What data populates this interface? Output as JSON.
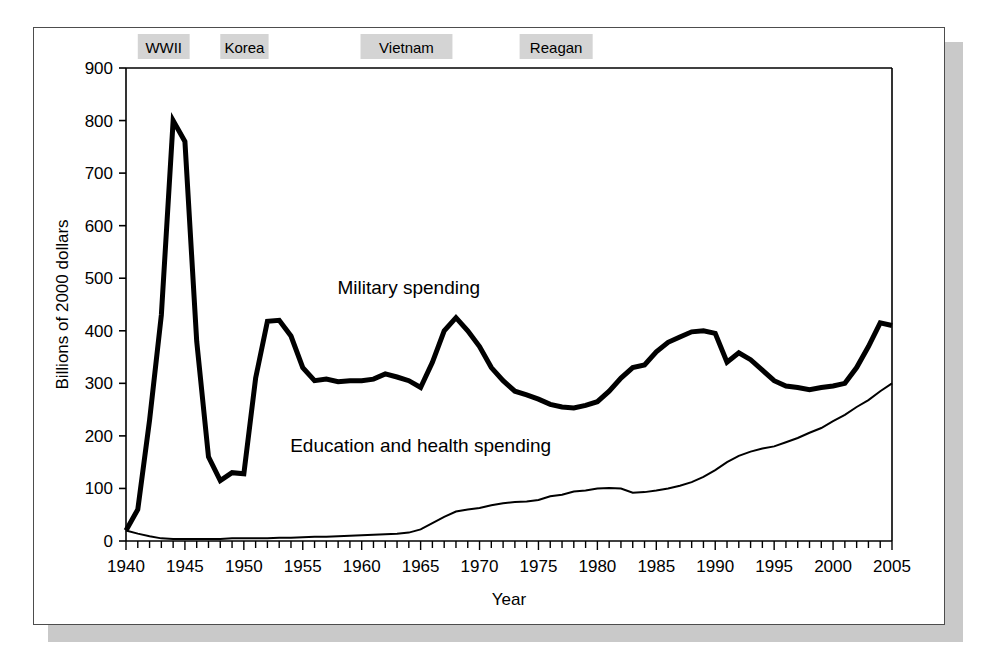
{
  "figure": {
    "background_color": "#ffffff",
    "frame_color": "#4d4d4d",
    "shadow_color": "#c9c9c9"
  },
  "chart_data": {
    "type": "line",
    "title": "",
    "xlabel": "Year",
    "ylabel": "Billions of 2000 dollars",
    "xlim": [
      1940,
      2005
    ],
    "ylim": [
      0,
      900
    ],
    "ytick_step": 100,
    "xtick_step": 1,
    "xtick_label_step": 5,
    "grid": false,
    "legend_position": "inline-annotation",
    "ytick_labels": [
      "0",
      "100",
      "200",
      "300",
      "400",
      "500",
      "600",
      "700",
      "800",
      "900"
    ],
    "xtick_labels": [
      "1940",
      "1945",
      "1950",
      "1955",
      "1960",
      "1965",
      "1970",
      "1975",
      "1980",
      "1985",
      "1990",
      "1995",
      "2000",
      "2005"
    ],
    "x": [
      1940,
      1941,
      1942,
      1943,
      1944,
      1945,
      1946,
      1947,
      1948,
      1949,
      1950,
      1951,
      1952,
      1953,
      1954,
      1955,
      1956,
      1957,
      1958,
      1959,
      1960,
      1961,
      1962,
      1963,
      1964,
      1965,
      1966,
      1967,
      1968,
      1969,
      1970,
      1971,
      1972,
      1973,
      1974,
      1975,
      1976,
      1977,
      1978,
      1979,
      1980,
      1981,
      1982,
      1983,
      1984,
      1985,
      1986,
      1987,
      1988,
      1989,
      1990,
      1991,
      1992,
      1993,
      1994,
      1995,
      1996,
      1997,
      1998,
      1999,
      2000,
      2001,
      2002,
      2003,
      2004,
      2005
    ],
    "series": [
      {
        "name": "Military spending",
        "label": "Military spending",
        "color": "#000000",
        "line_width": 5,
        "label_x": 1964,
        "label_y": 470,
        "values": [
          20,
          60,
          230,
          430,
          800,
          760,
          380,
          160,
          115,
          130,
          128,
          310,
          418,
          420,
          390,
          330,
          305,
          308,
          303,
          305,
          305,
          308,
          318,
          312,
          305,
          292,
          340,
          400,
          425,
          400,
          370,
          330,
          305,
          285,
          278,
          270,
          260,
          255,
          253,
          258,
          265,
          285,
          310,
          330,
          335,
          360,
          378,
          388,
          398,
          400,
          395,
          340,
          358,
          345,
          325,
          305,
          295,
          292,
          288,
          292,
          295,
          300,
          330,
          370,
          415,
          410
        ]
      },
      {
        "name": "Education and health spending",
        "label": "Education and health spending",
        "color": "#000000",
        "line_width": 2,
        "label_x": 1965,
        "label_y": 170,
        "values": [
          20,
          14,
          9,
          5,
          4,
          4,
          4,
          4,
          4,
          5,
          5,
          5,
          5,
          6,
          6,
          7,
          8,
          8,
          9,
          10,
          11,
          12,
          13,
          14,
          16,
          22,
          34,
          46,
          56,
          60,
          63,
          68,
          72,
          74,
          75,
          78,
          85,
          88,
          94,
          96,
          100,
          101,
          100,
          92,
          93,
          96,
          100,
          105,
          112,
          122,
          135,
          150,
          162,
          170,
          176,
          180,
          188,
          196,
          206,
          215,
          228,
          240,
          255,
          268,
          285,
          300
        ]
      }
    ],
    "annotations": [
      {
        "text": "WWII",
        "x_start": 1941.0,
        "x_end": 1945.4
      },
      {
        "text": "Korea",
        "x_start": 1948.0,
        "x_end": 1952.1
      },
      {
        "text": "Vietnam",
        "x_start": 1959.9,
        "x_end": 1967.7
      },
      {
        "text": "Reagan",
        "x_start": 1973.4,
        "x_end": 1979.6
      }
    ]
  }
}
